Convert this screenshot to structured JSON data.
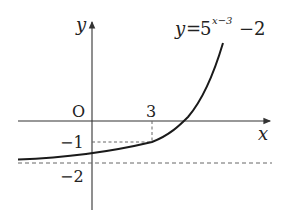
{
  "diagram": {
    "function_label": {
      "lhs": "y",
      "eq": "=",
      "base": "5",
      "exponent": "x−3",
      "tail": "−2"
    },
    "axes": {
      "x_label": "x",
      "y_label": "y",
      "origin_label": "O"
    },
    "ticks": {
      "x": [
        "3"
      ],
      "y": [
        "−1",
        "−2"
      ]
    },
    "asymptote": "y = −2",
    "marked_point": {
      "x": 3,
      "y": -1
    },
    "colors": {
      "curve": "#1a1a1a",
      "axes": "#333333",
      "dashed": "#666666"
    }
  }
}
